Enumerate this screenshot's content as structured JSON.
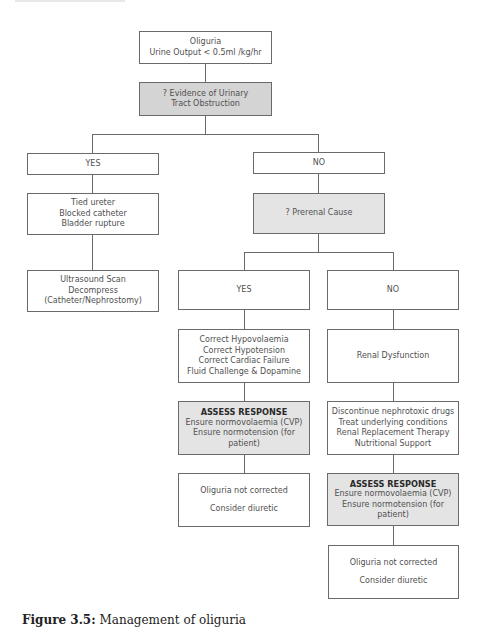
{
  "flowchart": {
    "start": {
      "lines": [
        "Oliguria",
        "Urine Output < 0.5ml /kg/hr"
      ]
    },
    "q_obstruction": {
      "lines": [
        "? Evidence of Urinary",
        "Tract Obstruction"
      ]
    },
    "branch_yes": {
      "label": "YES"
    },
    "branch_no": {
      "label": "NO"
    },
    "obstruction_causes": {
      "lines": [
        "Tied ureter",
        "Blocked catheter",
        "Bladder rupture"
      ]
    },
    "obstruction_action": {
      "lines": [
        "Ultrasound Scan",
        "Decompress",
        "(Catheter/Nephrostomy)"
      ]
    },
    "q_prerenal": {
      "lines": [
        "? Prerenal Cause"
      ]
    },
    "prerenal_yes": {
      "label": "YES"
    },
    "prerenal_no": {
      "label": "NO"
    },
    "prerenal_actions": {
      "lines": [
        "Correct Hypovolaemia",
        "Correct Hypotension",
        "Correct Cardiac Failure",
        "Fluid Challenge & Dopamine"
      ]
    },
    "renal_dysfunction": {
      "lines": [
        "Renal Dysfunction"
      ]
    },
    "assess_left": {
      "heading": "ASSESS RESPONSE",
      "lines": [
        "Ensure normovolaemia (CVP)",
        "Ensure normotension (for patient)"
      ]
    },
    "renal_actions": {
      "lines": [
        "Discontinue nephrotoxic drugs",
        "Treat underlying conditions",
        "Renal Replacement Therapy",
        "Nutritional Support"
      ]
    },
    "not_corrected_left": {
      "line1": "Oliguria not corrected",
      "line2": "Consider diuretic"
    },
    "assess_right": {
      "heading": "ASSESS RESPONSE",
      "lines": [
        "Ensure normovolaemia (CVP)",
        "Ensure normotension (for patient)"
      ]
    },
    "not_corrected_right": {
      "line1": "Oliguria not corrected",
      "line2": "Consider diuretic"
    }
  },
  "caption": {
    "label": "Figure 3.5:",
    "text": "Management of oliguria"
  },
  "colors": {
    "border": "#6a6a6a",
    "decision_fill": "#d4d4d4",
    "assess_fill": "#e4e4e4"
  }
}
